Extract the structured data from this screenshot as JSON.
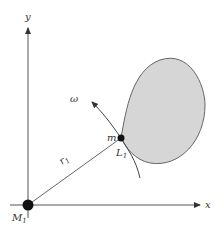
{
  "diagram": {
    "axes": {
      "x_label": "x",
      "y_label": "y"
    },
    "labels": {
      "origin_mass": "M",
      "origin_sub": "1",
      "point_mass": "m",
      "lagrange_point": "L",
      "lagrange_sub": "1",
      "radius": "r",
      "radius_sub": "1",
      "angular_velocity": "ω"
    },
    "colors": {
      "lobe_fill": "#d6d6d6",
      "lobe_stroke": "#666666",
      "axis": "#555555",
      "dot": "#111111"
    }
  }
}
